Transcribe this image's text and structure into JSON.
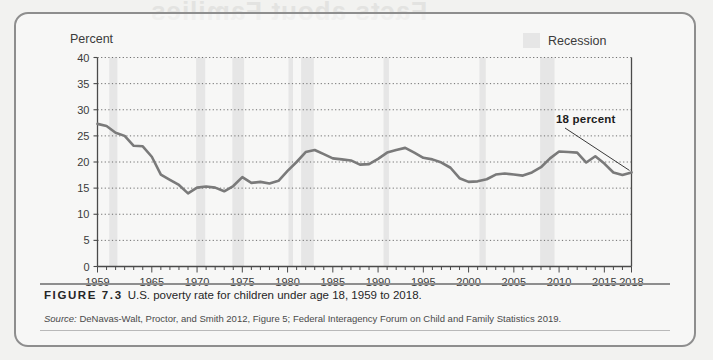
{
  "figure": {
    "caption_number": "FIGURE 7.3",
    "caption_text": "U.S. poverty rate for children under age 18, 1959 to 2018.",
    "source_label": "Source:",
    "source_text": " DeNavas-Walt, Proctor, and Smith 2012, Figure 5; Federal Interagency Forum on Child and Family Statistics 2019.",
    "bleed_text": "Facts about Families",
    "frame_color": "#8e8e8e",
    "page_background": "#f2f2f0"
  },
  "legend": {
    "swatch_color": "#e6e6e6",
    "label": "Recession",
    "position": "top-right"
  },
  "annotation": {
    "label": "18 percent",
    "points_to_year": 2018,
    "points_to_value": 18
  },
  "chart_data": {
    "type": "line",
    "title": "U.S. poverty rate for children under age 18, 1959 to 2018",
    "xlabel": "",
    "ylabel": "Percent",
    "xlim": [
      1959,
      2018
    ],
    "ylim": [
      0,
      40
    ],
    "ytick_values": [
      0,
      5,
      10,
      15,
      20,
      25,
      30,
      35,
      40
    ],
    "ytick_labels": [
      "0",
      "5",
      "10",
      "15",
      "20",
      "25",
      "30",
      "35",
      "40"
    ],
    "xtick_labels": [
      "1959",
      "1965",
      "1970",
      "1975",
      "1980",
      "1985",
      "1990",
      "1995",
      "2000",
      "2005",
      "2010",
      "2015",
      "2018"
    ],
    "xtick_values": [
      1959,
      1965,
      1970,
      1975,
      1980,
      1985,
      1990,
      1995,
      2000,
      2005,
      2010,
      2015,
      2018
    ],
    "minor_tick_interval": 1,
    "grid": "horizontal-dotted",
    "line_color": "#7a7a7a",
    "line_width": 2.6,
    "series": [
      {
        "name": "Poverty rate, children under 18",
        "x": [
          1959,
          1960,
          1961,
          1962,
          1963,
          1964,
          1965,
          1966,
          1967,
          1968,
          1969,
          1970,
          1971,
          1972,
          1973,
          1974,
          1975,
          1976,
          1977,
          1978,
          1979,
          1980,
          1981,
          1982,
          1983,
          1984,
          1985,
          1986,
          1987,
          1988,
          1989,
          1990,
          1991,
          1992,
          1993,
          1994,
          1995,
          1996,
          1997,
          1998,
          1999,
          2000,
          2001,
          2002,
          2003,
          2004,
          2005,
          2006,
          2007,
          2008,
          2009,
          2010,
          2011,
          2012,
          2013,
          2014,
          2015,
          2016,
          2017,
          2018
        ],
        "values": [
          27.3,
          26.9,
          25.6,
          25.0,
          23.1,
          23.0,
          21.0,
          17.6,
          16.6,
          15.6,
          14.0,
          15.1,
          15.3,
          15.1,
          14.4,
          15.4,
          17.1,
          16.0,
          16.2,
          15.9,
          16.4,
          18.3,
          20.0,
          21.9,
          22.3,
          21.5,
          20.7,
          20.5,
          20.3,
          19.5,
          19.6,
          20.6,
          21.8,
          22.3,
          22.7,
          21.8,
          20.8,
          20.5,
          19.9,
          18.9,
          16.9,
          16.2,
          16.3,
          16.7,
          17.6,
          17.8,
          17.6,
          17.4,
          18.0,
          19.0,
          20.7,
          22.0,
          21.9,
          21.8,
          19.9,
          21.1,
          19.7,
          18.0,
          17.5,
          18.0
        ]
      }
    ],
    "recession_bands": [
      {
        "start": 1960.3,
        "end": 1961.2
      },
      {
        "start": 1969.9,
        "end": 1970.9
      },
      {
        "start": 1973.9,
        "end": 1975.2
      },
      {
        "start": 1980.1,
        "end": 1980.6
      },
      {
        "start": 1981.5,
        "end": 1982.9
      },
      {
        "start": 1990.6,
        "end": 1991.2
      },
      {
        "start": 2001.2,
        "end": 2001.9
      },
      {
        "start": 2007.9,
        "end": 2009.5
      }
    ],
    "recession_band_color": "#e6e6e6",
    "final_value_label": "18 percent"
  }
}
